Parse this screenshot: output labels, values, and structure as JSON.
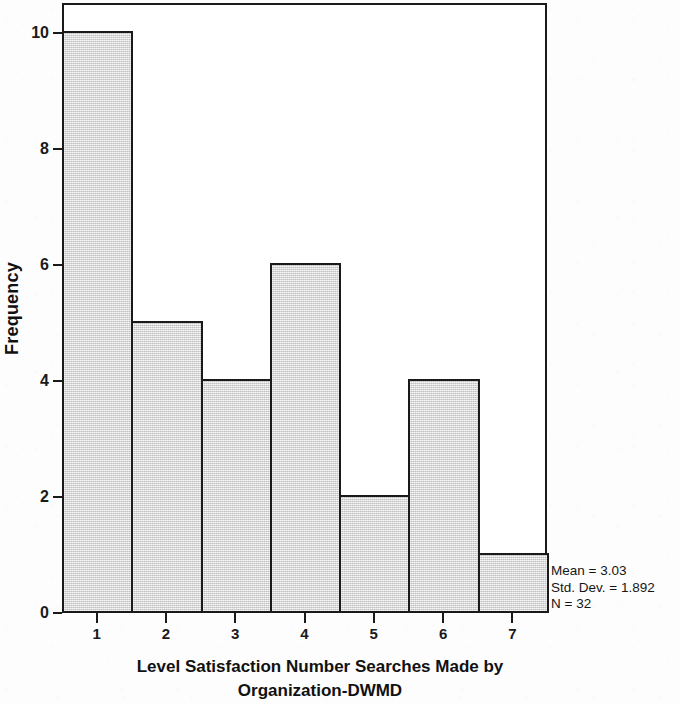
{
  "chart_data": {
    "type": "bar",
    "title": "",
    "xlabel": "Level Satisfaction Number Searches Made by Organization-DWMD",
    "xlabel_lines": [
      "Level Satisfaction Number Searches Made by",
      "Organization-DWMD"
    ],
    "ylabel": "Frequency",
    "categories": [
      "1",
      "2",
      "3",
      "4",
      "5",
      "6",
      "7"
    ],
    "values": [
      10,
      5,
      4,
      6,
      2,
      4,
      1
    ],
    "x_tick_labels": [
      "1",
      "2",
      "3",
      "4",
      "5",
      "6",
      "7"
    ],
    "y_tick_labels": [
      "0",
      "2",
      "4",
      "6",
      "8",
      "10"
    ],
    "y_tick_values": [
      0,
      2,
      4,
      6,
      8,
      10
    ],
    "ylim": [
      0,
      10.5
    ],
    "grid": false,
    "legend": false,
    "bar_fill_color": "#d6d6d6",
    "bar_edge_color": "#1a1a1a",
    "frame": true,
    "annotations": {
      "mean_label": "Mean = 3.03",
      "std_dev_label": "Std. Dev. = 1.892",
      "n_label": "N = 32",
      "mean": 3.03,
      "std_dev": 1.892,
      "n": 32
    }
  },
  "axes": {
    "y_title": "Frequency",
    "y_ticks": [
      {
        "label": "10",
        "value": 10
      },
      {
        "label": "8",
        "value": 8
      },
      {
        "label": "6",
        "value": 6
      },
      {
        "label": "4",
        "value": 4
      },
      {
        "label": "2",
        "value": 2
      },
      {
        "label": "0",
        "value": 0
      }
    ],
    "x_ticks": [
      {
        "label": "1",
        "value": 1
      },
      {
        "label": "2",
        "value": 2
      },
      {
        "label": "3",
        "value": 3
      },
      {
        "label": "4",
        "value": 4
      },
      {
        "label": "5",
        "value": 5
      },
      {
        "label": "6",
        "value": 6
      },
      {
        "label": "7",
        "value": 7
      }
    ],
    "x_title_line1": "Level Satisfaction Number Searches Made by",
    "x_title_line2": "Organization-DWMD"
  },
  "stats": {
    "mean": "Mean = 3.03",
    "std_dev": "Std. Dev. = 1.892",
    "n": "N = 32"
  }
}
